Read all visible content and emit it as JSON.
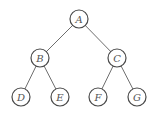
{
  "diagram": {
    "type": "binary-tree",
    "nodes": [
      {
        "id": "A",
        "label": "A",
        "x": 79,
        "y": 19
      },
      {
        "id": "B",
        "label": "B",
        "x": 40,
        "y": 58
      },
      {
        "id": "C",
        "label": "C",
        "x": 117,
        "y": 58
      },
      {
        "id": "D",
        "label": "D",
        "x": 21,
        "y": 97
      },
      {
        "id": "E",
        "label": "E",
        "x": 60,
        "y": 97
      },
      {
        "id": "F",
        "label": "F",
        "x": 98,
        "y": 97
      },
      {
        "id": "G",
        "label": "G",
        "x": 137,
        "y": 97
      }
    ],
    "edges": [
      {
        "from": "A",
        "to": "B"
      },
      {
        "from": "A",
        "to": "C"
      },
      {
        "from": "B",
        "to": "D"
      },
      {
        "from": "B",
        "to": "E"
      },
      {
        "from": "C",
        "to": "F"
      },
      {
        "from": "C",
        "to": "G"
      }
    ]
  }
}
